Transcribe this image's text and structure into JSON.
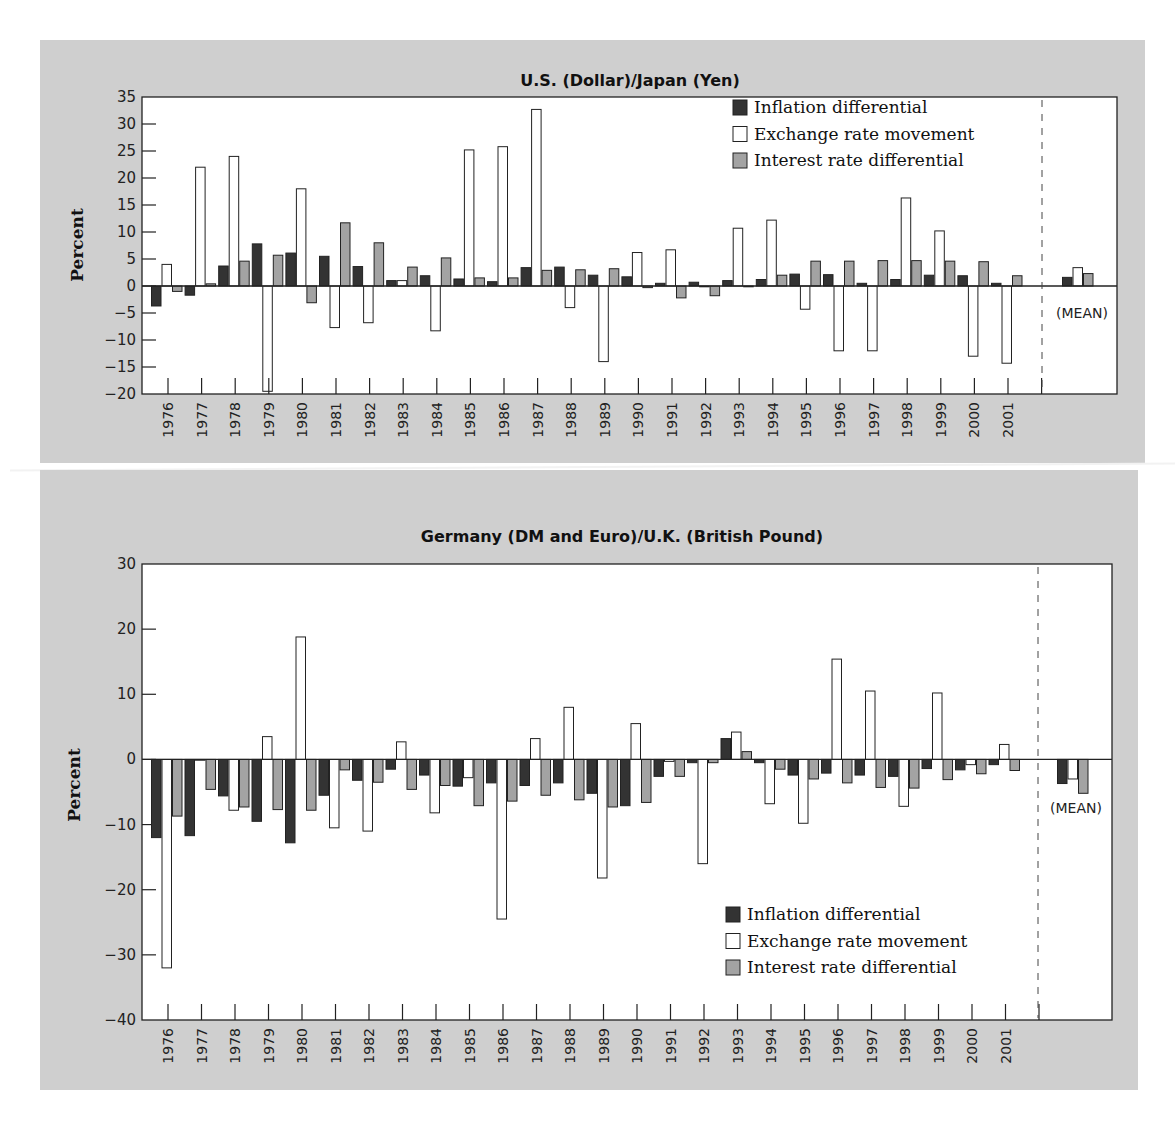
{
  "colors": {
    "panel_bg": "#cfcfcf",
    "plot_bg": "#ffffff",
    "inflation": "#333333",
    "exchange": "#ffffff",
    "interest": "#a3a3a3",
    "axis": "#222222"
  },
  "chart_data": [
    {
      "type": "bar",
      "title": "U.S. (Dollar)/Japan (Yen)",
      "xlabel": "",
      "ylabel": "Percent",
      "ylim": [
        -20,
        35
      ],
      "yticks": [
        35,
        30,
        25,
        20,
        15,
        10,
        5,
        0,
        -5,
        -10,
        -15,
        -20
      ],
      "grid": false,
      "legend_position": "upper-right",
      "categories": [
        "1976",
        "1977",
        "1978",
        "1979",
        "1980",
        "1981",
        "1982",
        "1983",
        "1984",
        "1985",
        "1986",
        "1987",
        "1988",
        "1989",
        "1990",
        "1991",
        "1992",
        "1993",
        "1994",
        "1995",
        "1996",
        "1997",
        "1998",
        "1999",
        "2000",
        "2001"
      ],
      "series": [
        {
          "name": "Inflation differential",
          "key": "inflation",
          "values": [
            -3.7,
            -1.7,
            3.7,
            7.8,
            6.1,
            5.5,
            3.6,
            1.0,
            1.9,
            1.3,
            0.8,
            3.4,
            3.5,
            2.0,
            1.7,
            0.5,
            0.7,
            1.0,
            1.2,
            2.2,
            2.1,
            0.5,
            1.2,
            2.0,
            1.9,
            0.5
          ]
        },
        {
          "name": "Exchange rate movement",
          "key": "exchange",
          "values": [
            4.0,
            22.0,
            24.0,
            -19.5,
            18.0,
            -7.7,
            -6.8,
            1.0,
            -8.3,
            25.2,
            25.8,
            32.7,
            -4.0,
            -14.0,
            6.2,
            6.7,
            0.0,
            10.7,
            12.2,
            -4.3,
            -12.0,
            -12.0,
            16.3,
            10.2,
            -13.0,
            -14.3
          ]
        },
        {
          "name": "Interest rate differential",
          "key": "interest",
          "values": [
            -1.0,
            0.4,
            4.6,
            5.7,
            -3.1,
            11.7,
            8.0,
            3.5,
            5.2,
            1.5,
            1.5,
            2.9,
            3.0,
            3.2,
            -0.3,
            -2.2,
            -1.8,
            0.0,
            2.0,
            4.6,
            4.6,
            4.7,
            4.7,
            4.6,
            4.5,
            1.9
          ]
        }
      ],
      "mean": {
        "label": "(MEAN)",
        "values": [
          1.6,
          3.4,
          2.3
        ]
      }
    },
    {
      "type": "bar",
      "title": "Germany (DM and Euro)/U.K. (British Pound)",
      "xlabel": "",
      "ylabel": "Percent",
      "ylim": [
        -40,
        30
      ],
      "yticks": [
        30,
        20,
        10,
        0,
        -10,
        -20,
        -30,
        -40
      ],
      "grid": false,
      "legend_position": "lower-right",
      "categories": [
        "1976",
        "1977",
        "1978",
        "1979",
        "1980",
        "1981",
        "1982",
        "1983",
        "1984",
        "1985",
        "1986",
        "1987",
        "1988",
        "1989",
        "1990",
        "1991",
        "1992",
        "1993",
        "1994",
        "1995",
        "1996",
        "1997",
        "1998",
        "1999",
        "2000",
        "2001"
      ],
      "series": [
        {
          "name": "Inflation differential",
          "key": "inflation",
          "values": [
            -12.0,
            -11.7,
            -5.6,
            -9.5,
            -12.8,
            -5.5,
            -3.2,
            -1.5,
            -2.4,
            -4.1,
            -3.6,
            -4.0,
            -3.6,
            -5.2,
            -7.1,
            -2.6,
            -0.5,
            3.2,
            -0.5,
            -2.4,
            -2.1,
            -2.4,
            -2.6,
            -1.4,
            -1.6,
            -0.8
          ]
        },
        {
          "name": "Exchange rate movement",
          "key": "exchange",
          "values": [
            -32.0,
            0.0,
            -7.8,
            3.5,
            18.8,
            -10.5,
            -11.0,
            2.7,
            -8.2,
            -2.8,
            -24.5,
            3.2,
            8.0,
            -18.2,
            5.5,
            -0.3,
            -16.0,
            4.2,
            -6.8,
            -9.8,
            15.4,
            10.5,
            -7.2,
            10.2,
            -0.8,
            2.3
          ]
        },
        {
          "name": "Interest rate differential",
          "key": "interest",
          "values": [
            -8.7,
            -4.6,
            -7.3,
            -7.7,
            -7.8,
            -1.6,
            -3.5,
            -4.6,
            -4.0,
            -7.1,
            -6.4,
            -5.5,
            -6.2,
            -7.3,
            -6.6,
            -2.6,
            -0.5,
            1.2,
            -1.5,
            -3.0,
            -3.6,
            -4.3,
            -4.4,
            -3.1,
            -2.2,
            -1.7
          ]
        }
      ],
      "mean": {
        "label": "(MEAN)",
        "values": [
          -3.7,
          -3.0,
          -5.2
        ]
      }
    }
  ]
}
